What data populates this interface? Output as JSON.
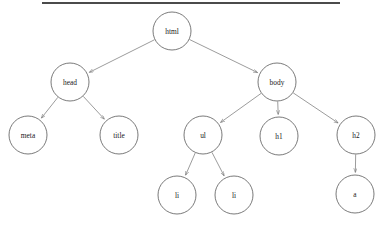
{
  "diagram": {
    "title_rule": {
      "name": "top-horizontal-rule",
      "color": "#4b4b4b"
    },
    "style": {
      "background": "#ffffff",
      "node_fill": "#ffffff",
      "node_stroke": "#585858",
      "edge_stroke": "#7b7b7b",
      "label_color": "#1b1b1b",
      "node_radius": 19
    },
    "type": "dom-tree",
    "nodes": [
      {
        "id": "html",
        "label": "html",
        "cx": 172,
        "cy": 31,
        "r": 19,
        "level": 0
      },
      {
        "id": "head",
        "label": "head",
        "cx": 70,
        "cy": 82,
        "r": 19,
        "level": 1
      },
      {
        "id": "body",
        "label": "body",
        "cx": 277,
        "cy": 82,
        "r": 19,
        "level": 1
      },
      {
        "id": "meta",
        "label": "meta",
        "cx": 28,
        "cy": 135,
        "r": 19,
        "level": 2
      },
      {
        "id": "title",
        "label": "title",
        "cx": 119,
        "cy": 135,
        "r": 19,
        "level": 2
      },
      {
        "id": "ul",
        "label": "ul",
        "cx": 203,
        "cy": 135,
        "r": 19,
        "level": 2
      },
      {
        "id": "h1",
        "label": "h1",
        "cx": 279,
        "cy": 136,
        "r": 19,
        "level": 2
      },
      {
        "id": "h2",
        "label": "h2",
        "cx": 356,
        "cy": 135,
        "r": 19,
        "level": 2
      },
      {
        "id": "li1",
        "label": "li",
        "cx": 177,
        "cy": 195,
        "r": 19,
        "level": 3
      },
      {
        "id": "li2",
        "label": "li",
        "cx": 234,
        "cy": 195,
        "r": 19,
        "level": 3
      },
      {
        "id": "a",
        "label": "a",
        "cx": 355,
        "cy": 194,
        "r": 19,
        "level": 3
      }
    ],
    "edges": [
      {
        "from": "html",
        "to": "head",
        "arrow": true
      },
      {
        "from": "html",
        "to": "body",
        "arrow": true
      },
      {
        "from": "head",
        "to": "meta",
        "arrow": true
      },
      {
        "from": "head",
        "to": "title",
        "arrow": true
      },
      {
        "from": "body",
        "to": "ul",
        "arrow": true
      },
      {
        "from": "body",
        "to": "h1",
        "arrow": true
      },
      {
        "from": "body",
        "to": "h2",
        "arrow": true
      },
      {
        "from": "ul",
        "to": "li1",
        "arrow": true
      },
      {
        "from": "ul",
        "to": "li2",
        "arrow": true
      },
      {
        "from": "h2",
        "to": "a",
        "arrow": true
      }
    ]
  }
}
